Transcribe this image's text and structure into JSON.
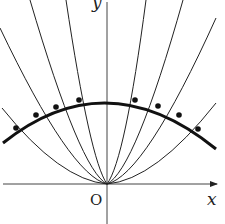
{
  "diagram": {
    "axes": {
      "x_label": "x",
      "y_label": "y",
      "origin_label": "O"
    },
    "colors": {
      "stroke": "#222222",
      "background": "#ffffff"
    },
    "parabolas_left": [
      [
        -26,
        170
      ],
      [
        -5,
        190
      ],
      [
        20,
        205
      ],
      [
        50,
        215
      ]
    ],
    "parabolas_right": [
      [
        160,
        215
      ],
      [
        185,
        205
      ],
      [
        210,
        190
      ],
      [
        230,
        170
      ]
    ],
    "points": [
      [
        16,
        128
      ],
      [
        36,
        115
      ],
      [
        56,
        107
      ],
      [
        79,
        100
      ],
      [
        135,
        100
      ],
      [
        158,
        106
      ],
      [
        179,
        115
      ],
      [
        198,
        129
      ]
    ]
  }
}
